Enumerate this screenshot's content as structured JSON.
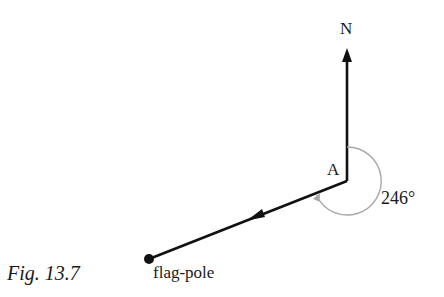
{
  "diagram": {
    "north_label": "N",
    "point_label": "A",
    "angle_label": "246°",
    "end_label": "flag-pole",
    "caption": "Fig. 13.7",
    "bearing_degrees": 246,
    "colors": {
      "line": "#111111",
      "angle_arc": "#a8a8a8",
      "text": "#1a1a1a"
    }
  }
}
